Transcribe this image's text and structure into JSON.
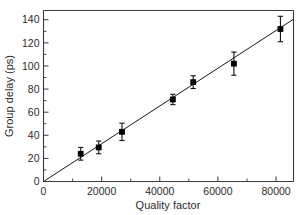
{
  "chart_data": {
    "type": "scatter",
    "title": "",
    "xlabel": "Quality factor",
    "ylabel": "Group delay (ps)",
    "xlim": [
      0,
      86000
    ],
    "ylim": [
      0,
      148
    ],
    "grid": false,
    "legend": null,
    "x_ticks": [
      0,
      20000,
      40000,
      60000,
      80000
    ],
    "x_tick_labels": [
      "0",
      "20000",
      "40000",
      "60000",
      "80000"
    ],
    "x_minor_ticks": [
      10000,
      30000,
      50000,
      70000
    ],
    "y_ticks": [
      0,
      20,
      40,
      60,
      80,
      100,
      120,
      140
    ],
    "y_tick_labels": [
      "0",
      "20",
      "40",
      "60",
      "80",
      "100",
      "120",
      "140"
    ],
    "y_minor_ticks": [
      10,
      30,
      50,
      70,
      90,
      110,
      130
    ],
    "marker_style": "filled-square",
    "marker_color": "#000000",
    "error_bar_direction": "y",
    "x": [
      12800,
      19000,
      27000,
      44500,
      51500,
      65500,
      81500
    ],
    "y": [
      24,
      29.5,
      43,
      71,
      86,
      102,
      132
    ],
    "y_error": [
      5.5,
      5.5,
      7.5,
      4.5,
      5.5,
      10,
      11
    ],
    "fit_line": {
      "type": "linear",
      "x_start": 0,
      "y_start": 0,
      "x_end": 86000,
      "y_end": 140.5
    }
  },
  "axes": {
    "x_title": "Quality factor",
    "y_title": "Group delay (ps)"
  },
  "colors": {
    "background": "#ffffff",
    "axis": "#3a3a3a",
    "data": "#000000",
    "fit": "#1a1a1a"
  }
}
